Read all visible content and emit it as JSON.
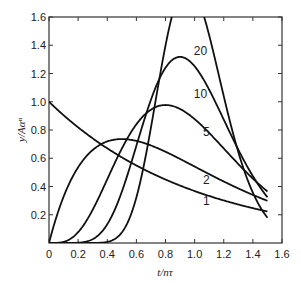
{
  "chart_data": {
    "type": "line",
    "title": "",
    "xlabel": "t/nτ",
    "ylabel": "y/Aαⁿ",
    "xlim": [
      0,
      1.6
    ],
    "ylim": [
      0,
      1.6
    ],
    "grid": false,
    "legend": "inline curve labels",
    "x_ticks": [
      0,
      0.2,
      0.4,
      0.6,
      0.8,
      1.0,
      1.2,
      1.4,
      1.6
    ],
    "x_tick_labels": [
      "0",
      "0.2",
      "0.4",
      "0.6",
      "0.8",
      "1.0",
      "1.2",
      "1.4",
      "1.6"
    ],
    "y_ticks": [
      0.2,
      0.4,
      0.6,
      0.8,
      1.0,
      1.2,
      1.4,
      1.6
    ],
    "y_tick_labels": [
      "0.2",
      "0.4",
      "0.6",
      "0.8",
      "1.0",
      "1.2",
      "1.4",
      "1.6"
    ],
    "x": [
      0,
      0.1,
      0.2,
      0.3,
      0.4,
      0.5,
      0.6,
      0.7,
      0.8,
      0.9,
      1.0,
      1.1,
      1.2,
      1.3,
      1.4,
      1.5
    ],
    "series": [
      {
        "name": "1",
        "values": [
          1.0,
          0.9,
          0.82,
          0.74,
          0.67,
          0.61,
          0.55,
          0.5,
          0.45,
          0.41,
          0.37,
          0.33,
          0.3,
          0.27,
          0.25,
          0.22
        ]
      },
      {
        "name": "2",
        "values": [
          0.0,
          0.33,
          0.54,
          0.66,
          0.72,
          0.74,
          0.72,
          0.69,
          0.65,
          0.59,
          0.54,
          0.49,
          0.44,
          0.39,
          0.34,
          0.3
        ]
      },
      {
        "name": "5",
        "values": [
          0.0,
          0.01,
          0.1,
          0.28,
          0.5,
          0.71,
          0.87,
          0.96,
          0.98,
          0.95,
          0.88,
          0.79,
          0.69,
          0.59,
          0.49,
          0.4
        ]
      },
      {
        "name": "10",
        "values": [
          0.0,
          0.0,
          0.0,
          0.05,
          0.22,
          0.5,
          0.85,
          1.14,
          1.3,
          1.32,
          1.25,
          1.11,
          0.94,
          0.76,
          0.6,
          0.46
        ]
      },
      {
        "name": "20",
        "values": [
          0.0,
          0.0,
          0.0,
          0.0,
          0.02,
          0.15,
          0.55,
          1.13,
          1.6,
          1.8,
          1.77,
          1.52,
          1.16,
          0.81,
          0.52,
          0.31
        ]
      }
    ],
    "curve_labels": [
      {
        "text": "1",
        "x": 1.08,
        "y": 0.27
      },
      {
        "text": "2",
        "x": 1.08,
        "y": 0.42
      },
      {
        "text": "5",
        "x": 1.08,
        "y": 0.76
      },
      {
        "text": "10",
        "x": 1.04,
        "y": 1.03
      },
      {
        "text": "20",
        "x": 1.04,
        "y": 1.33
      }
    ]
  }
}
